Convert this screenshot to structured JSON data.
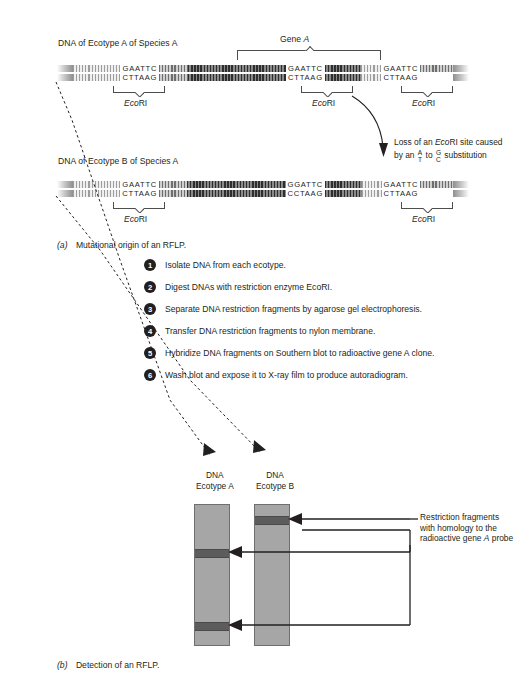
{
  "figure": {
    "panel_a_caption_letter": "(a)",
    "panel_a_caption_text": "Mutational origin of an RFLP.",
    "panel_b_caption_letter": "(b)",
    "panel_b_caption_text": "Detection of an RFLP."
  },
  "panel_a": {
    "ecotype_a_header": "DNA of Ecotype A of Species A",
    "ecotype_b_header": "DNA of Ecotype B of Species A",
    "gene_bracket_label_prefix": "Gene ",
    "gene_bracket_label_italic": "A",
    "enzyme_label_italic": "Eco",
    "enzyme_label_rest": "RI",
    "strand_a_sites": [
      {
        "top": "GAATTC",
        "bottom": "CTTAAG",
        "enzyme": "EcoRI"
      },
      {
        "top": "GAATTC",
        "bottom": "CTTAAG",
        "enzyme": "EcoRI"
      },
      {
        "top": "GAATTC",
        "bottom": "CTTAAG",
        "enzyme": "EcoRI"
      }
    ],
    "strand_b_sites": [
      {
        "top": "GAATTC",
        "bottom": "CTTAAG",
        "enzyme": "EcoRI"
      },
      {
        "top": "GGATTC",
        "bottom": "CCTAAG",
        "enzyme": ""
      },
      {
        "top": "GAATTC",
        "bottom": "CTTAAG",
        "enzyme": "EcoRI"
      }
    ],
    "mutation_note": {
      "line1_pre": "Loss of an ",
      "line1_italic": "Eco",
      "line1_post": "RI site caused",
      "line2_pre": "by an ",
      "line2_frac1_top": "A",
      "line2_frac1_bottom": "T",
      "line2_mid": " to ",
      "line2_frac2_top": "G",
      "line2_frac2_bottom": "C",
      "line2_post": " substitution"
    }
  },
  "steps": [
    {
      "n": "1",
      "text": "Isolate DNA from each ecotype."
    },
    {
      "n": "2",
      "text": "Digest DNAs with restriction enzyme EcoRI."
    },
    {
      "n": "3",
      "text": "Separate DNA restriction fragments by agarose gel electrophoresis."
    },
    {
      "n": "4",
      "text": "Transfer DNA restriction fragments to nylon membrane."
    },
    {
      "n": "5",
      "text": "Hybridize DNA fragments on Southern blot to radioactive gene A clone."
    },
    {
      "n": "6",
      "text": "Wash blot and expose it to X-ray film to produce autoradiogram."
    }
  ],
  "panel_b": {
    "lane_a_label_line1": "DNA",
    "lane_a_label_line2": "Ecotype A",
    "lane_b_label_line1": "DNA",
    "lane_b_label_line2": "Ecotype B",
    "annotation": {
      "line1": "Restriction fragments",
      "line2": "with homology to the",
      "line3_pre": "radioactive gene ",
      "line3_italic": "A",
      "line3_post": " probe"
    },
    "gel_data": {
      "lanes": [
        {
          "name": "DNA Ecotype A",
          "bands": [
            0.33,
            0.84
          ]
        },
        {
          "name": "DNA Ecotype B",
          "bands": [
            0.09
          ]
        }
      ]
    }
  },
  "colors": {
    "ink": "#231f20",
    "lane_fill": "#a6a6a6",
    "band_fill": "#5c5c5c",
    "rule": "#4d4d4d"
  }
}
